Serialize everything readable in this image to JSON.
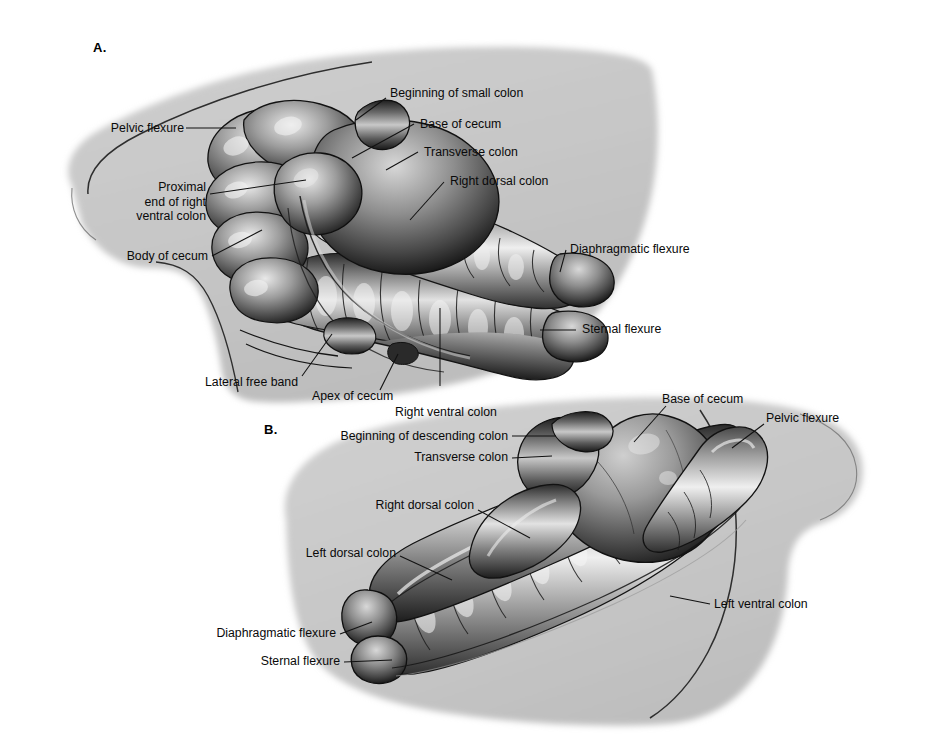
{
  "figure": {
    "background_color": "#ffffff",
    "body_silhouette_color": "#c6c6c6",
    "label_text_color": "#0a0a0a",
    "leader_line_color": "#111111"
  },
  "panels": [
    {
      "id": "A",
      "letter": "A.",
      "labels": [
        {
          "id": "a-pelvic-flexure",
          "text": "Pelvic flexure"
        },
        {
          "id": "a-proximal-end",
          "text": "Proximal\nend of right\nventral colon"
        },
        {
          "id": "a-body-of-cecum",
          "text": "Body of cecum"
        },
        {
          "id": "a-beginning-small-colon",
          "text": "Beginning of small colon"
        },
        {
          "id": "a-base-of-cecum",
          "text": "Base of cecum"
        },
        {
          "id": "a-transverse-colon",
          "text": "Transverse colon"
        },
        {
          "id": "a-right-dorsal-colon",
          "text": "Right dorsal colon"
        },
        {
          "id": "a-diaphragmatic-flexure",
          "text": "Diaphragmatic flexure"
        },
        {
          "id": "a-sternal-flexure",
          "text": "Sternal flexure"
        },
        {
          "id": "a-lateral-free-band",
          "text": "Lateral free band"
        },
        {
          "id": "a-apex-of-cecum",
          "text": "Apex of cecum"
        },
        {
          "id": "a-right-ventral-colon",
          "text": "Right ventral colon"
        }
      ]
    },
    {
      "id": "B",
      "letter": "B.",
      "labels": [
        {
          "id": "b-beginning-descending",
          "text": "Beginning of descending colon"
        },
        {
          "id": "b-transverse-colon",
          "text": "Transverse colon"
        },
        {
          "id": "b-right-dorsal-colon",
          "text": "Right dorsal colon"
        },
        {
          "id": "b-left-dorsal-colon",
          "text": "Left dorsal colon"
        },
        {
          "id": "b-diaphragmatic-flexure",
          "text": "Diaphragmatic flexure"
        },
        {
          "id": "b-sternal-flexure",
          "text": "Sternal flexure"
        },
        {
          "id": "b-base-of-cecum",
          "text": "Base of cecum"
        },
        {
          "id": "b-pelvic-flexure",
          "text": "Pelvic flexure"
        },
        {
          "id": "b-left-ventral-colon",
          "text": "Left ventral colon"
        }
      ]
    }
  ]
}
